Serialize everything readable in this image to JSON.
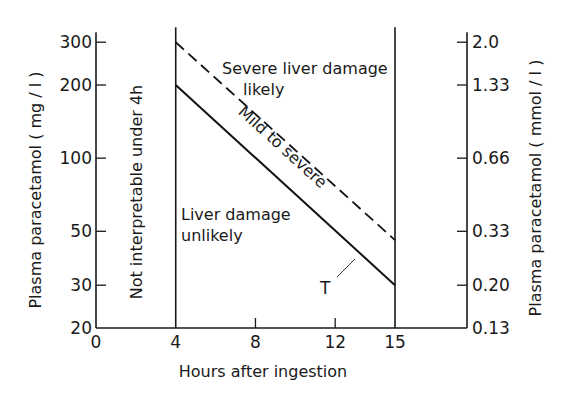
{
  "chart_data": {
    "type": "line",
    "title": "",
    "xlabel": "Hours after ingestion",
    "ylabel": "Plasma paracetamol ( mg / l )",
    "ylabel_right": "Plasma paracetamol ( mmol / l )",
    "xlim": [
      0,
      15
    ],
    "ylim": [
      20,
      300
    ],
    "yscale": "log",
    "grid": false,
    "x_ticks": [
      0,
      4,
      8,
      12,
      15
    ],
    "x_tick_labels": [
      "0",
      "4",
      "8",
      "12",
      "15"
    ],
    "y_ticks": [
      20,
      30,
      50,
      100,
      200,
      300
    ],
    "y_tick_labels": [
      "20",
      "30",
      "50",
      "100",
      "200",
      "300"
    ],
    "y_right_ticks_mg": [
      20,
      30,
      50,
      100,
      200,
      300
    ],
    "y_right_tick_labels": [
      "0.13",
      "0.20",
      "0.33",
      "0.66",
      "1.33",
      "2.0"
    ],
    "vertical_lines": [
      4,
      15
    ],
    "series": [
      {
        "name": "Treatment line (T)",
        "style": "solid",
        "x": [
          4,
          15
        ],
        "y": [
          200,
          30
        ]
      },
      {
        "name": "Severe damage line",
        "style": "dashed",
        "x": [
          4,
          15
        ],
        "y": [
          300,
          46
        ]
      }
    ],
    "annotations": [
      {
        "text": "Not interpretable under 4h",
        "region": "0-4h",
        "rotation": -90
      },
      {
        "text": "Severe liver damage",
        "line2": "likely",
        "region": "above dashed line"
      },
      {
        "text": "Mild to severe",
        "region": "between lines",
        "rotation": 42
      },
      {
        "text": "Liver damage",
        "line2": "unlikely",
        "region": "below solid line"
      },
      {
        "text": "T",
        "points_to": "solid line"
      }
    ]
  }
}
